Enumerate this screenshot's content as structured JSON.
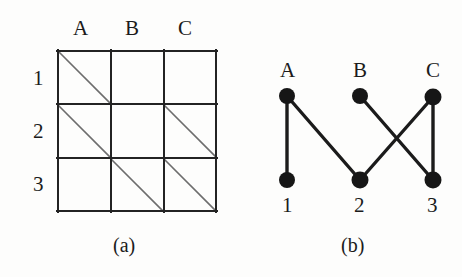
{
  "figure": {
    "background_color": "#fdfdfc",
    "ink_color": "#1b1b1b",
    "diagonal_color": "#6d6d6d",
    "panels": [
      {
        "id": "a",
        "caption": "(a)",
        "type": "matrix-grid",
        "column_headers": [
          "A",
          "B",
          "C"
        ],
        "row_headers": [
          "1",
          "2",
          "3"
        ],
        "filled_cells": [
          {
            "row": "1",
            "column": "A"
          },
          {
            "row": "2",
            "column": "A"
          },
          {
            "row": "2",
            "column": "C"
          },
          {
            "row": "3",
            "column": "B"
          },
          {
            "row": "3",
            "column": "C"
          }
        ],
        "matrix": [
          {
            "row": "1",
            "cells": [
              1,
              0,
              0
            ]
          },
          {
            "row": "2",
            "cells": [
              1,
              0,
              1
            ]
          },
          {
            "row": "3",
            "cells": [
              0,
              1,
              1
            ]
          }
        ]
      },
      {
        "id": "b",
        "caption": "(b)",
        "type": "bipartite-graph",
        "top_nodes": [
          "A",
          "B",
          "C"
        ],
        "bottom_nodes": [
          "1",
          "2",
          "3"
        ],
        "edges": [
          {
            "from": "A",
            "to": "1"
          },
          {
            "from": "A",
            "to": "2"
          },
          {
            "from": "B",
            "to": "3"
          },
          {
            "from": "C",
            "to": "2"
          },
          {
            "from": "C",
            "to": "3"
          }
        ]
      }
    ]
  }
}
